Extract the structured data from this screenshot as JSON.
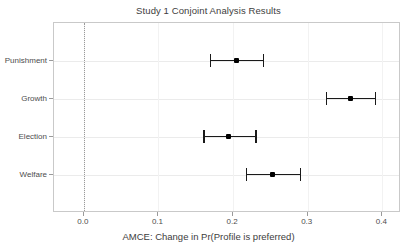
{
  "chart_data": {
    "type": "scatter",
    "title": "Study 1 Conjoint Analysis Results",
    "xlabel": "AMCE: Change in Pr(Profile is preferred)",
    "ylabel": "",
    "xlim": [
      -0.04,
      0.425
    ],
    "ylim": [
      0,
      5
    ],
    "grid": true,
    "legend": "none",
    "orientation": "horizontal",
    "reference_line": 0.0,
    "xticks": [
      0.0,
      0.1,
      0.2,
      0.3,
      0.4
    ],
    "xticklabels": [
      "0.0",
      "0.1",
      "0.2",
      "0.3",
      "0.4"
    ],
    "categories": [
      "Punishment",
      "Growth",
      "Election",
      "Welfare"
    ],
    "values": [
      0.204,
      0.357,
      0.194,
      0.253
    ],
    "ci_lower": [
      0.169,
      0.324,
      0.16,
      0.217
    ],
    "ci_upper": [
      0.24,
      0.39,
      0.23,
      0.289
    ],
    "points": [
      {
        "category": "Punishment",
        "estimate": 0.204,
        "ci_lower": 0.169,
        "ci_upper": 0.24
      },
      {
        "category": "Growth",
        "estimate": 0.357,
        "ci_lower": 0.324,
        "ci_upper": 0.39
      },
      {
        "category": "Election",
        "estimate": 0.194,
        "ci_lower": 0.16,
        "ci_upper": 0.23
      },
      {
        "category": "Welfare",
        "estimate": 0.253,
        "ci_lower": 0.217,
        "ci_upper": 0.289
      }
    ]
  },
  "colors": {
    "point": "#000000",
    "interval": "#1a1a1a",
    "panel_border": "#c9c9c9",
    "gridline": "#ebebeb",
    "zero_line": "#9a9a9a",
    "text": "#4d4d4d",
    "background": "#ffffff"
  }
}
